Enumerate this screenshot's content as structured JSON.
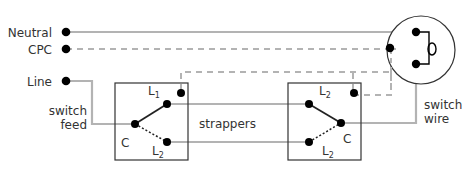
{
  "diagram": {
    "type": "two-way lighting circuit wiring",
    "colors": {
      "wire": "#b3b3b3",
      "cpc": "#b3b3b3",
      "terminal": "#000000",
      "box": "#333333",
      "text": "#333333"
    },
    "supply_labels": {
      "neutral": "Neutral",
      "cpc": "CPC",
      "line": "Line"
    },
    "annotations": {
      "switch_feed_1": "switch",
      "switch_feed_2": "feed",
      "strappers": "strappers",
      "switch_wire_1": "switch",
      "switch_wire_2": "wire"
    },
    "switch_1": {
      "terminals": {
        "l1": "L",
        "l1_sub": "1",
        "l2": "L",
        "l2_sub": "2",
        "common": "C"
      }
    },
    "switch_2": {
      "terminals": {
        "l1": "L",
        "l1_sub": "1",
        "l2": "L",
        "l2_sub": "2",
        "common": "C"
      }
    },
    "lamp": {
      "icon": "lamp-filament-icon"
    }
  }
}
